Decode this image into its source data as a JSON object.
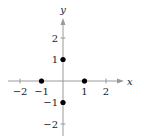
{
  "chart_data": {
    "type": "scatter",
    "title": "",
    "xlabel": "x",
    "ylabel": "y",
    "xlim": [
      -2.5,
      2.5
    ],
    "ylim": [
      -2.5,
      2.5
    ],
    "grid": false,
    "x_ticks": [
      -2,
      -1,
      1,
      2
    ],
    "y_ticks": [
      -2,
      -1,
      1,
      2
    ],
    "x_tick_labels": [
      "−2",
      "−1",
      "1",
      "2"
    ],
    "y_tick_labels": [
      "−2",
      "−1",
      "1",
      "2"
    ],
    "points": [
      {
        "x": 0,
        "y": 1
      },
      {
        "x": -1,
        "y": 0
      },
      {
        "x": 1,
        "y": 0
      },
      {
        "x": 0,
        "y": -1
      }
    ],
    "colors": {
      "axis": "#9a9a9a",
      "point": "#000000",
      "text": "#222222"
    }
  }
}
